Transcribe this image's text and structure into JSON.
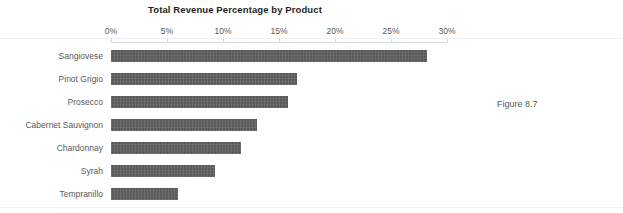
{
  "chart_data": {
    "type": "bar",
    "orientation": "horizontal",
    "title": "Total Revenue Percentage by Product",
    "xlabel": "",
    "ylabel": "",
    "categories": [
      "Sangiovese",
      "Pinot Grigio",
      "Prosecco",
      "Cabernet Sauvignon",
      "Chardonnay",
      "Syrah",
      "Tempranillo"
    ],
    "values": [
      28.2,
      16.6,
      15.8,
      13.0,
      11.6,
      9.3,
      6.0
    ],
    "value_unit": "%",
    "xlim": [
      0,
      30
    ],
    "xticks": [
      0,
      5,
      10,
      15,
      20,
      25,
      30
    ],
    "xtick_labels": [
      "0%",
      "5%",
      "10%",
      "15%",
      "20%",
      "25%",
      "30%"
    ],
    "grid": false,
    "legend": null,
    "bar_color": "#59595b",
    "axis_color": "#d9dadb",
    "text_color": "#58595b",
    "title_color": "#231f20"
  },
  "caption": {
    "text": "Figure 8.7"
  }
}
